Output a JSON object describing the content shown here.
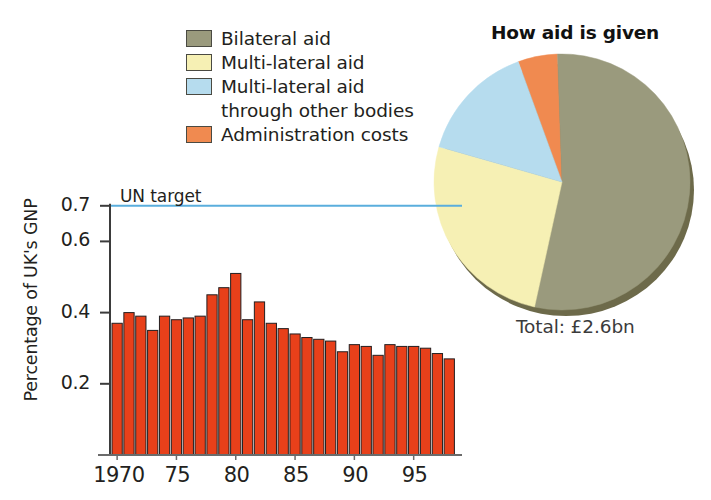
{
  "legend": {
    "items": [
      {
        "label": "Bilateral aid",
        "color": "#9a9a7d",
        "swatch": true
      },
      {
        "label": "Multi-lateral aid",
        "color": "#f6f0b4",
        "swatch": true
      },
      {
        "label": "Multi-lateral aid",
        "color": "#b6dcee",
        "swatch": true
      },
      {
        "label": "through other bodies",
        "color": "",
        "swatch": false
      },
      {
        "label": "Administration costs",
        "color": "#f08a50",
        "swatch": true
      }
    ]
  },
  "pie": {
    "title": "How aid is given",
    "total_label": "Total: £2.6bn"
  },
  "bar": {
    "un_target_label": "UN target",
    "ylabel": "Percentage of UK's GNP"
  },
  "chart_data": [
    {
      "type": "bar",
      "title": "",
      "xlabel": "",
      "ylabel": "Percentage of UK's GNP",
      "ylim": [
        0,
        0.75
      ],
      "yticks": [
        0.2,
        0.4,
        0.6,
        0.7
      ],
      "ytick_labels": [
        "0.2",
        "0.4",
        "0.6",
        "0.7"
      ],
      "xticks": [
        1970,
        1975,
        1980,
        1985,
        1990,
        1995
      ],
      "xtick_labels": [
        "1970",
        "75",
        "80",
        "85",
        "90",
        "95"
      ],
      "grid": false,
      "bar_color": "#e8401a",
      "bar_edge_color": "#231f20",
      "annotations": [
        {
          "text": "UN target",
          "type": "hline",
          "y": 0.7,
          "color": "#5aaedd"
        }
      ],
      "categories": [
        1970,
        1971,
        1972,
        1973,
        1974,
        1975,
        1976,
        1977,
        1978,
        1979,
        1980,
        1981,
        1982,
        1983,
        1984,
        1985,
        1986,
        1987,
        1988,
        1989,
        1990,
        1991,
        1992,
        1993,
        1994,
        1995,
        1996,
        1997
      ],
      "values": [
        0.37,
        0.4,
        0.39,
        0.35,
        0.39,
        0.38,
        0.385,
        0.39,
        0.45,
        0.47,
        0.51,
        0.38,
        0.43,
        0.37,
        0.355,
        0.34,
        0.33,
        0.325,
        0.32,
        0.29,
        0.31,
        0.305,
        0.28,
        0.31,
        0.305,
        0.305,
        0.3,
        0.285,
        0.27
      ]
    },
    {
      "type": "pie",
      "title": "How aid is given",
      "labels": [
        "Bilateral aid",
        "Multi-lateral aid",
        "Multi-lateral aid through other bodies",
        "Administration costs"
      ],
      "values": [
        54,
        26,
        15,
        5
      ],
      "colors": [
        "#9a9a7d",
        "#f6f0b4",
        "#b6dcee",
        "#f08a50"
      ],
      "unit": "percent",
      "total": "Total: £2.6bn",
      "legend_position": "left"
    }
  ]
}
